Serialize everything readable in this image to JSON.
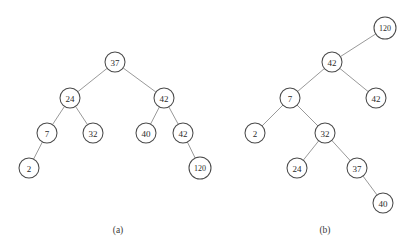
{
  "figure": {
    "background_color": "#ffffff",
    "node_fill_color": "#ffffff",
    "node_stroke_color": "#4a4a4a",
    "edge_color": "#8d8d8d",
    "text_color": "#2b2b2b",
    "node_radius": 10,
    "panels": [
      {
        "id": "panel-a",
        "caption": "(a)",
        "caption_x": 118,
        "caption_y": 230,
        "nodes": [
          {
            "id": "a-root-37",
            "label": "37",
            "x": 115,
            "y": 62,
            "r": 10
          },
          {
            "id": "a-24",
            "label": "24",
            "x": 70,
            "y": 98,
            "r": 10
          },
          {
            "id": "a-42-right",
            "label": "42",
            "x": 164,
            "y": 98,
            "r": 10
          },
          {
            "id": "a-7",
            "label": "7",
            "x": 47,
            "y": 133,
            "r": 10
          },
          {
            "id": "a-32",
            "label": "32",
            "x": 93,
            "y": 133,
            "r": 10
          },
          {
            "id": "a-40",
            "label": "40",
            "x": 146,
            "y": 133,
            "r": 10
          },
          {
            "id": "a-42-leaf",
            "label": "42",
            "x": 183,
            "y": 133,
            "r": 10
          },
          {
            "id": "a-2",
            "label": "2",
            "x": 29,
            "y": 168,
            "r": 10
          },
          {
            "id": "a-120",
            "label": "120",
            "x": 200,
            "y": 168,
            "r": 11
          }
        ],
        "edges": [
          {
            "from": "a-root-37",
            "to": "a-24"
          },
          {
            "from": "a-root-37",
            "to": "a-42-right"
          },
          {
            "from": "a-24",
            "to": "a-7"
          },
          {
            "from": "a-24",
            "to": "a-32"
          },
          {
            "from": "a-42-right",
            "to": "a-40"
          },
          {
            "from": "a-42-right",
            "to": "a-42-leaf"
          },
          {
            "from": "a-7",
            "to": "a-2"
          },
          {
            "from": "a-42-leaf",
            "to": "a-120"
          }
        ]
      },
      {
        "id": "panel-b",
        "caption": "(b)",
        "caption_x": 325,
        "caption_y": 230,
        "nodes": [
          {
            "id": "b-root-120",
            "label": "120",
            "x": 385,
            "y": 28,
            "r": 11
          },
          {
            "id": "b-42",
            "label": "42",
            "x": 332,
            "y": 62,
            "r": 10
          },
          {
            "id": "b-7",
            "label": "7",
            "x": 290,
            "y": 98,
            "r": 10
          },
          {
            "id": "b-42-leaf",
            "label": "42",
            "x": 376,
            "y": 98,
            "r": 10
          },
          {
            "id": "b-2",
            "label": "2",
            "x": 255,
            "y": 133,
            "r": 10
          },
          {
            "id": "b-32",
            "label": "32",
            "x": 325,
            "y": 133,
            "r": 10
          },
          {
            "id": "b-24",
            "label": "24",
            "x": 297,
            "y": 168,
            "r": 10
          },
          {
            "id": "b-37",
            "label": "37",
            "x": 357,
            "y": 168,
            "r": 10
          },
          {
            "id": "b-40",
            "label": "40",
            "x": 383,
            "y": 203,
            "r": 10
          }
        ],
        "edges": [
          {
            "from": "b-root-120",
            "to": "b-42"
          },
          {
            "from": "b-42",
            "to": "b-7"
          },
          {
            "from": "b-42",
            "to": "b-42-leaf"
          },
          {
            "from": "b-7",
            "to": "b-2"
          },
          {
            "from": "b-7",
            "to": "b-32"
          },
          {
            "from": "b-32",
            "to": "b-24"
          },
          {
            "from": "b-32",
            "to": "b-37"
          },
          {
            "from": "b-37",
            "to": "b-40"
          }
        ]
      }
    ]
  }
}
